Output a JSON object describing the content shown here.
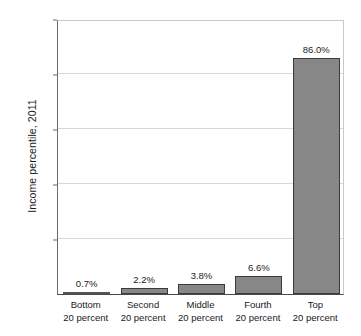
{
  "chart_data": {
    "type": "bar",
    "title": "",
    "xlabel": "",
    "ylabel": "Income percentile, 2011",
    "ylim": [
      0,
      100
    ],
    "grid": true,
    "legend": false,
    "categories": [
      "Bottom 20 percent",
      "Second 20 percent",
      "Middle 20 percent",
      "Fourth 20 percent",
      "Top 20 percent"
    ],
    "category_lines": [
      {
        "line1": "Bottom",
        "line2": "20 percent"
      },
      {
        "line1": "Second",
        "line2": "20 percent"
      },
      {
        "line1": "Middle",
        "line2": "20 percent"
      },
      {
        "line1": "Fourth",
        "line2": "20 percent"
      },
      {
        "line1": "Top",
        "line2": "20 percent"
      }
    ],
    "values": [
      0.7,
      2.2,
      3.8,
      6.6,
      86.0
    ],
    "value_labels": [
      "0.7%",
      "2.2%",
      "3.8%",
      "6.6%",
      "86.0%"
    ],
    "ytick_values": [
      100,
      80,
      60,
      40,
      20
    ],
    "ytick_labels": [
      "100%",
      "80",
      "60",
      "40",
      "20"
    ],
    "bar_color": "#878787",
    "bar_edge_color": "#3b3b3b",
    "grid_color": "#d8d8d8",
    "axis_color": "#4a4a4a",
    "text_color": "#1a1a1a"
  }
}
